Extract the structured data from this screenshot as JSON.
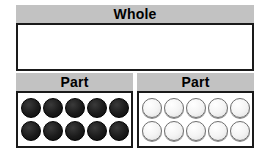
{
  "diagram": {
    "type": "part-part-whole-model",
    "whole": {
      "header_label": "Whole",
      "value_text": ""
    },
    "parts": [
      {
        "header_label": "Part",
        "counter_style": "dark",
        "counter_count": 10,
        "rows": [
          [
            "dark",
            "dark",
            "dark",
            "dark",
            "dark"
          ],
          [
            "dark",
            "dark",
            "dark",
            "dark",
            "dark"
          ]
        ]
      },
      {
        "header_label": "Part",
        "counter_style": "light",
        "counter_count": 10,
        "rows": [
          [
            "light",
            "light",
            "light",
            "light",
            "light"
          ],
          [
            "light",
            "light",
            "light",
            "light",
            "light"
          ]
        ]
      }
    ]
  },
  "colors": {
    "header_gray": "#c2c2c2",
    "border_black": "#1a1a1a",
    "counter_dark": "#111111",
    "counter_light": "#f4f4f4",
    "counter_light_outline": "#6e6e6e",
    "background": "#ffffff",
    "text": "#000000"
  }
}
